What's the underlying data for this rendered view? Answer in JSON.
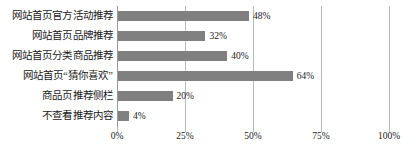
{
  "chart_data": {
    "type": "bar",
    "orientation": "horizontal",
    "title": "",
    "xlabel": "",
    "ylabel": "",
    "xlim": [
      0,
      100
    ],
    "grid": true,
    "legend": false,
    "categories": [
      "网站首页官方活动推荐",
      "网站首页品牌推荐",
      "网站首页分类商品推荐",
      "网站首页“猜你喜欢”",
      "商品页推荐侧栏",
      "不查看推荐内容"
    ],
    "values": [
      48,
      32,
      40,
      64,
      20,
      4
    ],
    "value_labels": [
      "48%",
      "32%",
      "40%",
      "64%",
      "20%",
      "4%"
    ],
    "xticks": [
      0,
      25,
      50,
      75,
      100
    ],
    "xtick_labels": [
      "0%",
      "25%",
      "50%",
      "75%",
      "100%"
    ],
    "colors": {
      "bar": "#808080",
      "gridline": "#b8b8b8",
      "axis": "#9a9a9a",
      "text": "#1a1a1a",
      "background": "#ffffff"
    }
  }
}
